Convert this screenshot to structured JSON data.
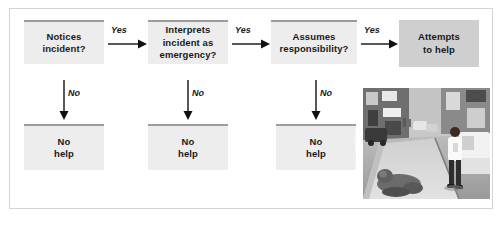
{
  "figure": {
    "frame_border_color": "#d4d4d4",
    "node_fill_light": "#ededed",
    "node_fill_dark": "#cfcfcf",
    "node_accent_color": "#9b9b9b",
    "text_color": "#1a1a1a"
  },
  "decision_nodes": [
    {
      "id": "notices",
      "label": "Notices\nincident?"
    },
    {
      "id": "interprets",
      "label": "Interprets\nincident as\nemergency?"
    },
    {
      "id": "assumes",
      "label": "Assumes\nresponsibility?"
    }
  ],
  "outcome_nodes": [
    {
      "id": "attempts",
      "label": "Attempts\nto help",
      "style": "dark"
    },
    {
      "id": "no-help-1",
      "label": "No\nhelp",
      "style": "light"
    },
    {
      "id": "no-help-2",
      "label": "No\nhelp",
      "style": "light"
    },
    {
      "id": "no-help-3",
      "label": "No\nhelp",
      "style": "light"
    }
  ],
  "edges": [
    {
      "id": "yes-1",
      "label": "Yes",
      "direction": "right",
      "from": "notices",
      "to": "interprets"
    },
    {
      "id": "yes-2",
      "label": "Yes",
      "direction": "right",
      "from": "interprets",
      "to": "assumes"
    },
    {
      "id": "yes-3",
      "label": "Yes",
      "direction": "right",
      "from": "assumes",
      "to": "attempts"
    },
    {
      "id": "no-1",
      "label": "No",
      "direction": "down",
      "from": "notices",
      "to": "no-help-1"
    },
    {
      "id": "no-2",
      "label": "No",
      "direction": "down",
      "from": "interprets",
      "to": "no-help-2"
    },
    {
      "id": "no-3",
      "label": "No",
      "direction": "down",
      "from": "assumes",
      "to": "no-help-3"
    }
  ],
  "photo": {
    "caption_credit": "© Viviane Moos/CORBIS",
    "description": "Street scene: a man lying on the sidewalk while a pedestrian walks past"
  }
}
